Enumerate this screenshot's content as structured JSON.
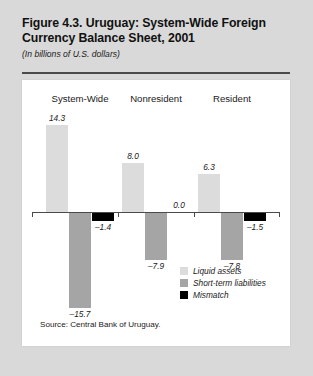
{
  "figure": {
    "title": "Figure 4.3. Uruguay: System-Wide Foreign Currency Balance Sheet, 2001",
    "title_line1": "Figure 4.3. Uruguay: System-Wide Foreign",
    "title_line2": "Currency Balance Sheet, 2001",
    "subtitle": "(In billions of U.S. dollars)",
    "source": "Source: Central Bank of Uruguay."
  },
  "colors": {
    "page_background": "#d9d9d9",
    "panel_background": "#ffffff",
    "rule": "#4a4a4a",
    "liquid_assets": "#dcdcdc",
    "short_term_liabilities": "#a5a5a5",
    "mismatch": "#000000",
    "text": "#1a1a1a"
  },
  "chart_data": {
    "type": "bar",
    "title": "Figure 4.3. Uruguay: System-Wide Foreign Currency Balance Sheet, 2001",
    "subtitle": "(In billions of U.S. dollars)",
    "xlabel": "",
    "ylabel": "",
    "ylim": [
      -16.5,
      15.5
    ],
    "grid": false,
    "legend_position": "inside-bottom-right",
    "categories": [
      "System-Wide",
      "Nonresident",
      "Resident"
    ],
    "series": [
      {
        "name": "Liquid assets",
        "values": [
          14.3,
          8.0,
          6.3
        ],
        "labels": [
          "14.3",
          "8.0",
          "6.3"
        ],
        "color": "#dcdcdc"
      },
      {
        "name": "Short-term liabilities",
        "values": [
          -15.7,
          -7.9,
          -7.8
        ],
        "labels": [
          "–15.7",
          "–7.9",
          "–7.8"
        ],
        "color": "#a5a5a5"
      },
      {
        "name": "Mismatch",
        "values": [
          -1.4,
          0.0,
          -1.5
        ],
        "labels": [
          "–1.4",
          "0.0",
          "–1.5"
        ],
        "color": "#000000"
      }
    ]
  },
  "legend": {
    "items": [
      {
        "label": "Liquid assets",
        "color": "#dcdcdc"
      },
      {
        "label": "Short-term liabilities",
        "color": "#a5a5a5"
      },
      {
        "label": "Mismatch",
        "color": "#000000"
      }
    ]
  }
}
